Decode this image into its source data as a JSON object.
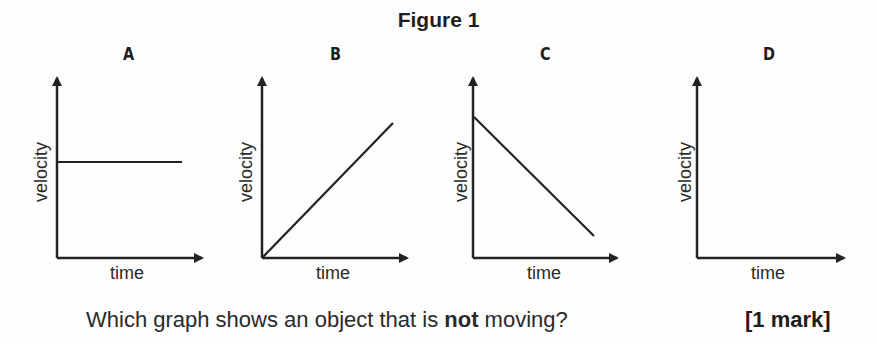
{
  "figure": {
    "title": "Figure 1",
    "graphs": [
      {
        "id": "A",
        "xlabel": "time",
        "ylabel": "velocity",
        "line": "horizontal (constant non-zero velocity)"
      },
      {
        "id": "B",
        "xlabel": "time",
        "ylabel": "velocity",
        "line": "increasing from origin"
      },
      {
        "id": "C",
        "xlabel": "time",
        "ylabel": "velocity",
        "line": "decreasing from high value"
      },
      {
        "id": "D",
        "xlabel": "time",
        "ylabel": "velocity",
        "line": "none (velocity along time axis = 0)"
      }
    ]
  },
  "question": {
    "prefix": "Which graph shows an object that is ",
    "emphasis": "not",
    "suffix": " moving?",
    "marks": "[1 mark]"
  },
  "colors": {
    "ink": "#222222",
    "background": "#fdfdfd"
  }
}
